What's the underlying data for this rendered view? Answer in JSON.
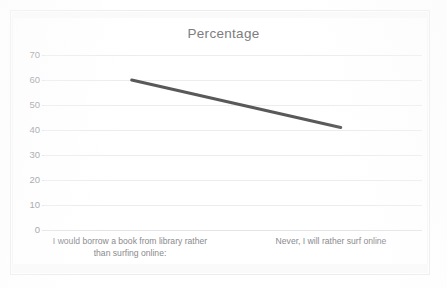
{
  "chart_data": {
    "type": "line",
    "title": "Percentage",
    "xlabel": "",
    "ylabel": "",
    "categories": [
      "I would borrow a book from library rather than surfing online:",
      "Never, I will rather surf online"
    ],
    "values": [
      60,
      41
    ],
    "series": [
      {
        "name": "Percentage",
        "values": [
          60,
          41
        ]
      }
    ],
    "ylim": [
      0,
      70
    ],
    "ytick_labels": [
      "70",
      "60",
      "50",
      "40",
      "30",
      "20",
      "10",
      "0"
    ],
    "ytick_values": [
      70,
      60,
      50,
      40,
      30,
      20,
      10,
      0
    ],
    "grid": true,
    "legend": "none",
    "line_color": "#595959",
    "grid_color": "#ececee",
    "title_color": "#7d7d80",
    "tick_label_color": "#8d8d90"
  },
  "x_labels": {
    "first_line_1": "I would borrow a book from library rather",
    "first_line_2": "than surfing online:",
    "second_line_1": "Never, I will rather surf online"
  }
}
